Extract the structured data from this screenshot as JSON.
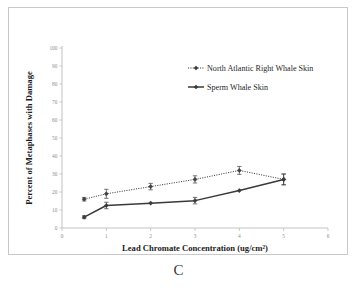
{
  "figure": {
    "panel_label": "C",
    "background_color": "#ffffff",
    "border_color": "#c9c9c9"
  },
  "chart_data": {
    "type": "line",
    "title": "",
    "subtitle": "",
    "xlabel": "Lead Chromate Concentration (ug/cm²)",
    "ylabel": "Percent of Metaphases with Damage",
    "xlim": [
      0,
      6
    ],
    "ylim": [
      0,
      100
    ],
    "xticks": [
      0,
      1,
      2,
      3,
      4,
      5,
      6
    ],
    "xtick_labels": [
      "0",
      "1",
      "2",
      "3",
      "4",
      "5",
      "6"
    ],
    "yticks": [
      0,
      10,
      20,
      30,
      40,
      50,
      60,
      70,
      80,
      90,
      100
    ],
    "ytick_labels": [
      "0",
      "10",
      "20",
      "30",
      "40",
      "50",
      "60",
      "70",
      "80",
      "90",
      "100"
    ],
    "grid": false,
    "legend_position": "upper right",
    "x": [
      0.5,
      1,
      2,
      3,
      4,
      5
    ],
    "series": [
      {
        "name": "North Atlantic Right Whale Skin",
        "linestyle": "dotted",
        "marker": "diamond",
        "color": "#404040",
        "values": [
          16,
          19,
          23,
          27,
          32,
          27
        ],
        "errors": [
          1.0,
          2.5,
          1.8,
          2.0,
          2.2,
          3.0
        ]
      },
      {
        "name": "Sperm Whale Skin",
        "linestyle": "solid",
        "marker": "diamond",
        "color": "#3a3a3a",
        "values": [
          6,
          12.5,
          13.8,
          15.2,
          20.8,
          27
        ],
        "errors": [
          0.8,
          1.8,
          0.0,
          1.8,
          0.0,
          3.0
        ]
      }
    ]
  },
  "legend": {
    "entries": [
      {
        "label": "North Atlantic Right Whale Skin",
        "style": "dotted"
      },
      {
        "label": "Sperm Whale Skin",
        "style": "solid"
      }
    ]
  }
}
